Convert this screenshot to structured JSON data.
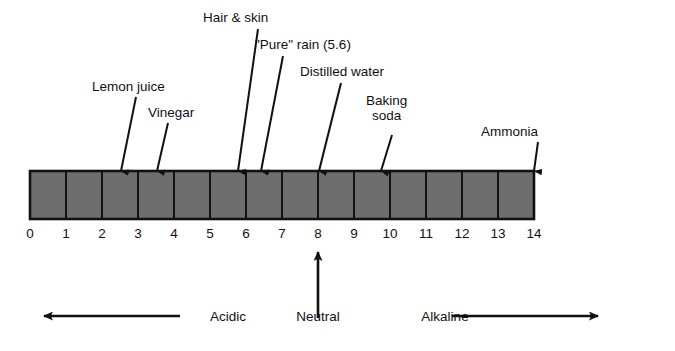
{
  "figure": {
    "copyright": "© Milady, a part of Cengage Learning",
    "colors": {
      "cell_fill": "#6e6e6e",
      "stroke": "#111111",
      "background": "#ffffff",
      "text": "#111111"
    }
  },
  "scale": {
    "min": 0,
    "max": 14,
    "tick_labels": [
      "0",
      "1",
      "2",
      "3",
      "4",
      "5",
      "6",
      "7",
      "8",
      "9",
      "10",
      "11",
      "12",
      "13",
      "14"
    ],
    "cell_count": 14
  },
  "callouts": [
    {
      "label": "Lemon juice",
      "ph": 2.3,
      "label_x": 92,
      "label_y": 79,
      "tip_x": 121,
      "tip_y": 171,
      "tail_x": 136,
      "tail_y": 97
    },
    {
      "label": "Vinegar",
      "ph": 3.0,
      "label_x": 148,
      "label_y": 105,
      "tip_x": 157,
      "tip_y": 171,
      "tail_x": 168,
      "tail_y": 123
    },
    {
      "label": "Hair & skin",
      "ph": 5.0,
      "label_x": 203,
      "label_y": 10,
      "tip_x": 238,
      "tip_y": 171,
      "tail_x": 258,
      "tail_y": 29
    },
    {
      "label": "\"Pure\" rain (5.6)",
      "ph": 5.6,
      "label_x": 255,
      "label_y": 37,
      "tip_x": 261,
      "tip_y": 171,
      "tail_x": 283,
      "tail_y": 56
    },
    {
      "label": "Distilled water",
      "ph": 7.0,
      "label_x": 300,
      "label_y": 64,
      "tip_x": 319,
      "tip_y": 171,
      "tail_x": 341,
      "tail_y": 83
    },
    {
      "label": "Baking\nsoda",
      "ph": 8.3,
      "label_x": 366,
      "label_y": 93,
      "tip_x": 381,
      "tip_y": 171,
      "tail_x": 392,
      "tail_y": 135
    },
    {
      "label": "Ammonia",
      "ph": 12.0,
      "label_x": 481,
      "label_y": 124,
      "tip_x": 534,
      "tip_y": 171,
      "tail_x": 538,
      "tail_y": 142
    }
  ],
  "zones": {
    "acidic": {
      "label": "Acidic",
      "arrow_from_x": 180,
      "arrow_to_x": 44,
      "y": 316
    },
    "neutral": {
      "label": "Neutral",
      "ph": 7,
      "arrow_from_y": 318,
      "arrow_to_y": 252,
      "x": 318
    },
    "alkaline": {
      "label": "Alkaline",
      "arrow_from_x": 452,
      "arrow_to_x": 598,
      "y": 316
    }
  }
}
